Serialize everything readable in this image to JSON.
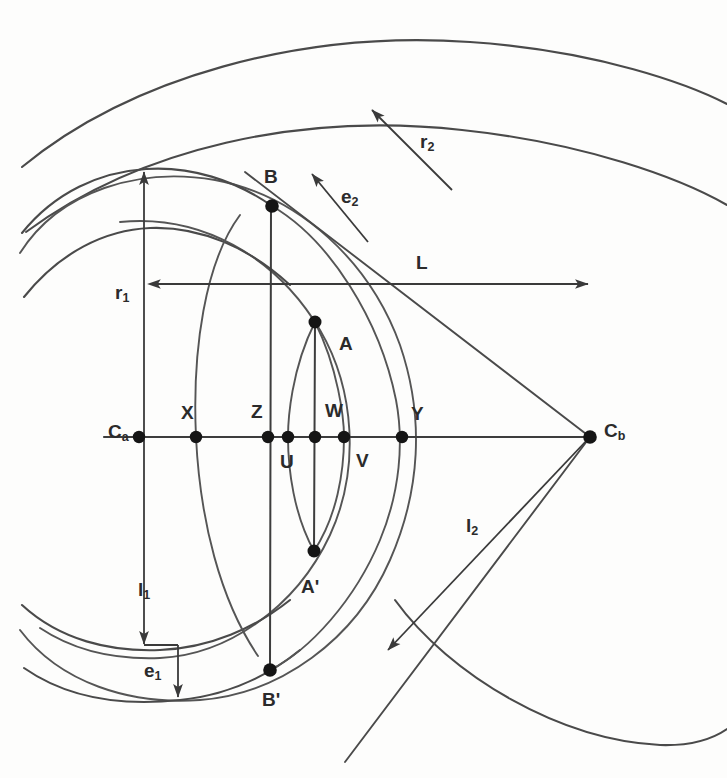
{
  "figure": {
    "type": "geometry-diagram",
    "background_color": "#fdfdfc",
    "stroke_color": "#4a4a4a",
    "dot_color": "#151515"
  },
  "labels": {
    "center_left": "C",
    "center_left_sub": "a",
    "center_right": "C",
    "center_right_sub": "b",
    "point_b": "B",
    "point_b_prime": "B'",
    "point_a": "A",
    "point_a_prime": "A'",
    "point_x": "X",
    "point_z": "Z",
    "point_u": "U",
    "point_w": "W",
    "point_v": "V",
    "point_y": "Y",
    "radius_1": "r",
    "radius_1_sub": "1",
    "radius_2": "r",
    "radius_2_sub": "2",
    "length_1": "l",
    "length_1_sub": "1",
    "length_2": "l",
    "length_2_sub": "2",
    "epsilon_1": "e",
    "epsilon_1_sub": "1",
    "epsilon_2": "e",
    "epsilon_2_sub": "2",
    "distance_L": "L"
  },
  "points": [
    {
      "name": "Ca",
      "label": "C",
      "sub": "a",
      "x": 139,
      "y": 437
    },
    {
      "name": "X",
      "label": "X",
      "sub": "",
      "x": 196,
      "y": 437
    },
    {
      "name": "Z",
      "label": "Z",
      "sub": "",
      "x": 268,
      "y": 437
    },
    {
      "name": "U",
      "label": "U",
      "sub": "",
      "x": 288,
      "y": 437
    },
    {
      "name": "W",
      "label": "W",
      "sub": "",
      "x": 315,
      "y": 437
    },
    {
      "name": "V",
      "label": "V",
      "sub": "",
      "x": 344,
      "y": 437
    },
    {
      "name": "Y",
      "label": "Y",
      "sub": "",
      "x": 402,
      "y": 437
    },
    {
      "name": "Cb",
      "label": "C",
      "sub": "b",
      "x": 590,
      "y": 437
    },
    {
      "name": "B",
      "label": "B",
      "sub": "",
      "x": 272,
      "y": 206
    },
    {
      "name": "Bp",
      "label": "B'",
      "sub": "",
      "x": 270,
      "y": 670
    },
    {
      "name": "A",
      "label": "A",
      "sub": "",
      "x": 315,
      "y": 322
    },
    {
      "name": "Ap",
      "label": "A'",
      "sub": "",
      "x": 314,
      "y": 551
    }
  ],
  "dimensions": [
    {
      "name": "r1",
      "label": "r",
      "sub": "1",
      "orientation": "vertical-up",
      "x": 144,
      "y1": 437,
      "y2": 172
    },
    {
      "name": "l1",
      "label": "l",
      "sub": "1",
      "orientation": "vertical-down",
      "x": 144,
      "y1": 437,
      "y2": 644
    },
    {
      "name": "e1",
      "label": "e",
      "sub": "1",
      "orientation": "vertical-down",
      "x": 178,
      "y1": 645,
      "y2": 697
    },
    {
      "name": "L",
      "label": "L",
      "sub": "",
      "orientation": "horizontal-both",
      "y": 284,
      "x1": 148,
      "x2": 590
    },
    {
      "name": "r2",
      "label": "r",
      "sub": "2",
      "orientation": "diagonal-up-left",
      "x1": 452,
      "y1": 190,
      "x2": 372,
      "y2": 110
    },
    {
      "name": "e2",
      "label": "e",
      "sub": "2",
      "orientation": "diagonal-up-left",
      "x1": 368,
      "y1": 242,
      "x2": 312,
      "y2": 174
    },
    {
      "name": "l2",
      "label": "l",
      "sub": "2",
      "orientation": "diagonal-down-left",
      "x1": 590,
      "y1": 437,
      "x2": 388,
      "y2": 650
    }
  ],
  "label_positions": {
    "Ca": {
      "x": 108,
      "y": 433
    },
    "Cb": {
      "x": 604,
      "y": 432
    },
    "X": {
      "x": 181,
      "y": 414
    },
    "Z": {
      "x": 251,
      "y": 413
    },
    "U": {
      "x": 283,
      "y": 461
    },
    "W": {
      "x": 327,
      "y": 412
    },
    "V": {
      "x": 358,
      "y": 461
    },
    "Y": {
      "x": 412,
      "y": 415
    },
    "B": {
      "x": 265,
      "y": 180
    },
    "Bp": {
      "x": 268,
      "y": 700
    },
    "A": {
      "x": 341,
      "y": 345
    },
    "Ap": {
      "x": 305,
      "y": 586
    },
    "r1": {
      "x": 118,
      "y": 294
    },
    "l1": {
      "x": 141,
      "y": 591
    },
    "e1": {
      "x": 147,
      "y": 671
    },
    "L": {
      "x": 420,
      "y": 265
    },
    "r2": {
      "x": 427,
      "y": 143
    },
    "e2": {
      "x": 347,
      "y": 198
    },
    "l2": {
      "x": 471,
      "y": 527
    }
  }
}
